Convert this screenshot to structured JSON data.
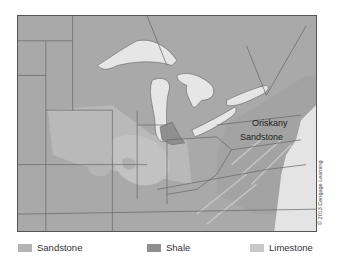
{
  "map": {
    "title_label": {
      "line1": "Oriskany",
      "line2": "Sandstone"
    },
    "colors": {
      "land": "#a9a9a9",
      "lake": "#e6e6e6",
      "ocean": "#e4e4e4",
      "border": "#666666",
      "sandstone": "#b4b4b4",
      "shale": "#8f8f8f",
      "limestone": "#c8c8c8"
    }
  },
  "copyright": "© 2013 Cengage Learning",
  "legend": {
    "items": [
      {
        "label": "Sandstone",
        "color": "#b4b4b4"
      },
      {
        "label": "Shale",
        "color": "#8f8f8f"
      },
      {
        "label": "Limestone",
        "color": "#c8c8c8"
      }
    ]
  }
}
